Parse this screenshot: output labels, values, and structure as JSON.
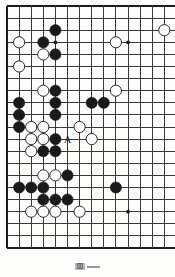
{
  "figure": {
    "kind": "go-board-diagram",
    "caption_label": "図",
    "caption_rule": "—"
  },
  "board": {
    "line_color": "#3a3a3a",
    "border_color": "#1c1c1c",
    "background_color": "#fdfdfc",
    "black_color": "#1a1a1a",
    "white_color": "#ffffff",
    "white_edge_color": "#2b2b2b",
    "geometry": {
      "origin_x": 7,
      "origin_y": 6,
      "spacing": 12.1,
      "cols_visible": 14,
      "rows_visible": 21,
      "stone_radius": 5.6,
      "right_edge_cut": true
    },
    "star_points": [
      {
        "col": 4,
        "row": 3
      },
      {
        "col": 10,
        "row": 3
      },
      {
        "col": 10,
        "row": 17
      }
    ],
    "markers": [
      {
        "col": 5,
        "row": 11,
        "label": "A",
        "color": "#111111"
      }
    ],
    "stones": [
      {
        "col": 4,
        "row": 2,
        "color": "black"
      },
      {
        "col": 13,
        "row": 2,
        "color": "white"
      },
      {
        "col": 1,
        "row": 3,
        "color": "white"
      },
      {
        "col": 3,
        "row": 3,
        "color": "black"
      },
      {
        "col": 9,
        "row": 3,
        "color": "white"
      },
      {
        "col": 3,
        "row": 4,
        "color": "white"
      },
      {
        "col": 4,
        "row": 4,
        "color": "black"
      },
      {
        "col": 1,
        "row": 5,
        "color": "white"
      },
      {
        "col": 3,
        "row": 7,
        "color": "white"
      },
      {
        "col": 4,
        "row": 7,
        "color": "black"
      },
      {
        "col": 9,
        "row": 7,
        "color": "white"
      },
      {
        "col": 1,
        "row": 8,
        "color": "black"
      },
      {
        "col": 4,
        "row": 8,
        "color": "black"
      },
      {
        "col": 7,
        "row": 8,
        "color": "black"
      },
      {
        "col": 8,
        "row": 8,
        "color": "black"
      },
      {
        "col": 1,
        "row": 9,
        "color": "black"
      },
      {
        "col": 4,
        "row": 9,
        "color": "black"
      },
      {
        "col": 1,
        "row": 10,
        "color": "black"
      },
      {
        "col": 2,
        "row": 10,
        "color": "white"
      },
      {
        "col": 3,
        "row": 10,
        "color": "white"
      },
      {
        "col": 6,
        "row": 10,
        "color": "white"
      },
      {
        "col": 2,
        "row": 11,
        "color": "white"
      },
      {
        "col": 3,
        "row": 11,
        "color": "white"
      },
      {
        "col": 4,
        "row": 11,
        "color": "black"
      },
      {
        "col": 7,
        "row": 11,
        "color": "white"
      },
      {
        "col": 2,
        "row": 12,
        "color": "white"
      },
      {
        "col": 3,
        "row": 12,
        "color": "black"
      },
      {
        "col": 4,
        "row": 12,
        "color": "black"
      },
      {
        "col": 3,
        "row": 14,
        "color": "white"
      },
      {
        "col": 4,
        "row": 14,
        "color": "white"
      },
      {
        "col": 5,
        "row": 14,
        "color": "black"
      },
      {
        "col": 1,
        "row": 15,
        "color": "black"
      },
      {
        "col": 2,
        "row": 15,
        "color": "black"
      },
      {
        "col": 3,
        "row": 15,
        "color": "black"
      },
      {
        "col": 9,
        "row": 15,
        "color": "black"
      },
      {
        "col": 3,
        "row": 16,
        "color": "black"
      },
      {
        "col": 4,
        "row": 16,
        "color": "black"
      },
      {
        "col": 5,
        "row": 16,
        "color": "black"
      },
      {
        "col": 2,
        "row": 17,
        "color": "white"
      },
      {
        "col": 3,
        "row": 17,
        "color": "white"
      },
      {
        "col": 4,
        "row": 17,
        "color": "white"
      },
      {
        "col": 6,
        "row": 17,
        "color": "white"
      }
    ]
  }
}
